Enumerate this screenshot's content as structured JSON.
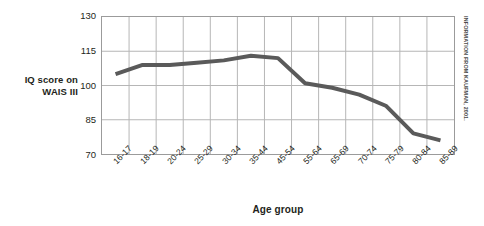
{
  "chart_data": {
    "type": "line",
    "title": "",
    "xlabel": "Age group",
    "ylabel": "IQ score on WAIS III",
    "ylabel_lines": [
      "IQ score on",
      "WAIS III"
    ],
    "categories": [
      "16-17",
      "18-19",
      "20-24",
      "25-29",
      "30-34",
      "35-44",
      "45-54",
      "55-64",
      "65-69",
      "70-74",
      "75-79",
      "80-84",
      "85-89"
    ],
    "values": [
      105,
      109,
      109,
      110,
      111,
      113,
      112,
      101,
      99,
      96,
      91,
      79,
      76
    ],
    "series": [
      {
        "name": "IQ score on WAIS III",
        "values": [
          105,
          109,
          109,
          110,
          111,
          113,
          112,
          101,
          99,
          96,
          91,
          79,
          76
        ],
        "color": "#5a5a5a"
      }
    ],
    "ylim": [
      70,
      130
    ],
    "yticks": [
      130,
      115,
      100,
      85,
      70
    ],
    "ytick_labels": [
      "130",
      "115",
      "100",
      "85",
      "70"
    ],
    "grid": true,
    "grid_color": "#b5b5b5",
    "legend": "none",
    "line_color": "#5a5a5a",
    "line_width": 4
  },
  "credit": {
    "text": "INFORMATION FROM KAUFMAN, 2001."
  },
  "colors": {
    "text": "#231f20",
    "axis": "#9b9b9b",
    "grid": "#b5b5b5",
    "line": "#5a5a5a",
    "background": "#ffffff"
  }
}
